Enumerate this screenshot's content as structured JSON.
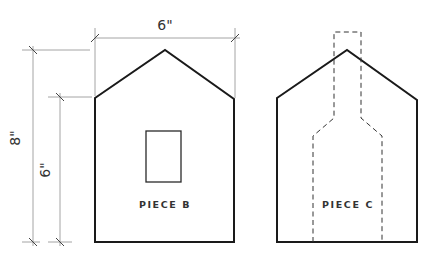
{
  "diagram": {
    "dimensions": {
      "width_label": "6\"",
      "total_height_label": "8\"",
      "wall_height_label": "6\""
    },
    "pieces": [
      {
        "label": "PIECE B",
        "feature": "window cutout"
      },
      {
        "label": "PIECE C",
        "feature": "dashed chimney outline"
      }
    ],
    "colors": {
      "outline": "#1a1a1a",
      "dimension_lines": "#9a9a9a",
      "background": "#ffffff"
    }
  }
}
